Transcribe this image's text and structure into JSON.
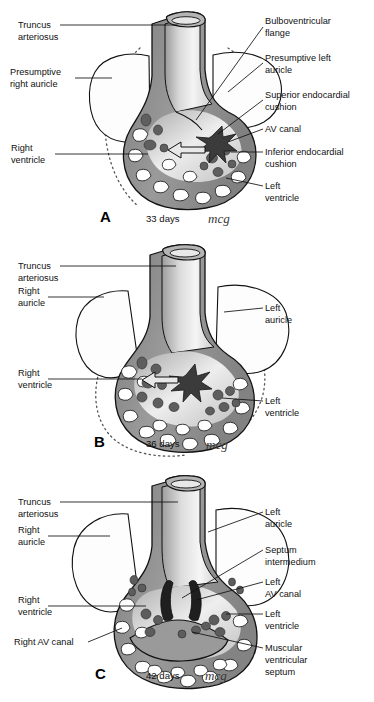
{
  "figure": {
    "signature": "mcg",
    "colors": {
      "myocardium": "#8c8c8c",
      "myocardium_dark": "#6e6e6e",
      "endocardial_cushion": "#4a4a4a",
      "lumen_light": "#f2f2f2",
      "trabecular_space": "#ffffff",
      "outline": "#111111",
      "auricle_fill": "#fdfdfd",
      "label_text": "#111111"
    }
  },
  "panels": [
    {
      "id": "A",
      "letter": "A",
      "age": "33 days",
      "signature": "mcg",
      "labels_left": [
        {
          "name": "truncus-arteriosus",
          "lines": [
            "Truncus",
            "arteriosus"
          ]
        },
        {
          "name": "presumptive-right-auricle",
          "lines": [
            "Presumptive",
            "right auricle"
          ]
        },
        {
          "name": "right-ventricle",
          "lines": [
            "Right",
            "ventricle"
          ]
        }
      ],
      "labels_right": [
        {
          "name": "bulboventricular-flange",
          "lines": [
            "Bulboventricular",
            "flange"
          ]
        },
        {
          "name": "presumptive-left-auricle",
          "lines": [
            "Presumptive left",
            "auricle"
          ]
        },
        {
          "name": "superior-endocardial-cushion",
          "lines": [
            "Superior endocardial",
            "cushion"
          ]
        },
        {
          "name": "av-canal",
          "lines": [
            "AV canal"
          ]
        },
        {
          "name": "inferior-endocardial-cushion",
          "lines": [
            "Inferior endocardial",
            "cushion"
          ]
        },
        {
          "name": "left-ventricle",
          "lines": [
            "Left",
            "ventricle"
          ]
        }
      ]
    },
    {
      "id": "B",
      "letter": "B",
      "age": "36 days",
      "signature": "mcg",
      "labels_left": [
        {
          "name": "truncus-arteriosus",
          "lines": [
            "Truncus",
            "arteriosus"
          ]
        },
        {
          "name": "right-auricle",
          "lines": [
            "Right",
            "auricle"
          ]
        },
        {
          "name": "right-ventricle",
          "lines": [
            "Right",
            "ventricle"
          ]
        }
      ],
      "labels_right": [
        {
          "name": "left-auricle",
          "lines": [
            "Left",
            "auricle"
          ]
        },
        {
          "name": "left-ventricle",
          "lines": [
            "Left",
            "ventricle"
          ]
        }
      ]
    },
    {
      "id": "C",
      "letter": "C",
      "age": "42 days",
      "signature": "mcg",
      "labels_left": [
        {
          "name": "truncus-arteriosus",
          "lines": [
            "Truncus",
            "arteriosus"
          ]
        },
        {
          "name": "right-auricle",
          "lines": [
            "Right",
            "auricle"
          ]
        },
        {
          "name": "right-ventricle",
          "lines": [
            "Right",
            "ventricle"
          ]
        },
        {
          "name": "right-av-canal",
          "lines": [
            "Right AV canal"
          ]
        }
      ],
      "labels_right": [
        {
          "name": "left-auricle",
          "lines": [
            "Left",
            "auricle"
          ]
        },
        {
          "name": "septum-intermedium",
          "lines": [
            "Septum",
            "intermedium"
          ]
        },
        {
          "name": "left-av-canal",
          "lines": [
            "Left",
            "AV canal"
          ]
        },
        {
          "name": "left-ventricle",
          "lines": [
            "Left",
            "ventricle"
          ]
        },
        {
          "name": "muscular-ventricular-septum",
          "lines": [
            "Muscular",
            "ventricular",
            "septum"
          ]
        }
      ]
    }
  ],
  "text": {
    "a_truncus_1": "Truncus",
    "a_truncus_2": "arteriosus",
    "a_presump_right_1": "Presumptive",
    "a_presump_right_2": "right auricle",
    "a_right_vent_1": "Right",
    "a_right_vent_2": "ventricle",
    "a_bulbo_1": "Bulboventricular",
    "a_bulbo_2": "flange",
    "a_presump_left_1": "Presumptive left",
    "a_presump_left_2": "auricle",
    "a_sup_cushion_1": "Superior endocardial",
    "a_sup_cushion_2": "cushion",
    "a_av_canal": "AV canal",
    "a_inf_cushion_1": "Inferior endocardial",
    "a_inf_cushion_2": "cushion",
    "a_left_vent_1": "Left",
    "a_left_vent_2": "ventricle",
    "a_letter": "A",
    "a_days": "33 days",
    "a_sig": "mcg",
    "b_truncus_1": "Truncus",
    "b_truncus_2": "arteriosus",
    "b_right_aur_1": "Right",
    "b_right_aur_2": "auricle",
    "b_right_vent_1": "Right",
    "b_right_vent_2": "ventricle",
    "b_left_aur_1": "Left",
    "b_left_aur_2": "auricle",
    "b_left_vent_1": "Left",
    "b_left_vent_2": "ventricle",
    "b_letter": "B",
    "b_days": "36 days",
    "b_sig": "mcg",
    "c_truncus_1": "Truncus",
    "c_truncus_2": "arteriosus",
    "c_right_aur_1": "Right",
    "c_right_aur_2": "auricle",
    "c_right_vent_1": "Right",
    "c_right_vent_2": "ventricle",
    "c_right_av": "Right AV canal",
    "c_left_aur_1": "Left",
    "c_left_aur_2": "auricle",
    "c_septum_1": "Septum",
    "c_septum_2": "intermedium",
    "c_left_av_1": "Left",
    "c_left_av_2": "AV canal",
    "c_left_vent_1": "Left",
    "c_left_vent_2": "ventricle",
    "c_musc_1": "Muscular",
    "c_musc_2": "ventricular",
    "c_musc_3": "septum",
    "c_letter": "C",
    "c_days": "42 days",
    "c_sig": "mcg"
  }
}
